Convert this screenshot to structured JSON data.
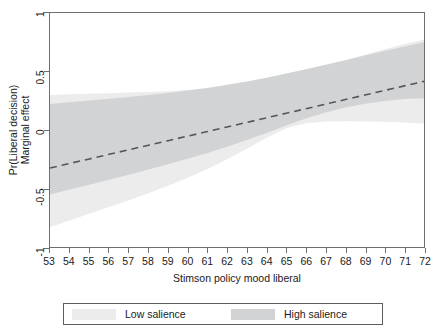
{
  "chart_data": {
    "type": "line",
    "title": "",
    "xlabel": "Stimson policy mood liberal",
    "ylabel_line1": "Pr(Liberal decision)",
    "ylabel_line2": "Marginal effect",
    "xlim": [
      53,
      72
    ],
    "ylim": [
      -1,
      1
    ],
    "grid": false,
    "legend_position": "bottom",
    "xticks": [
      53,
      54,
      55,
      56,
      57,
      58,
      59,
      60,
      61,
      62,
      63,
      64,
      65,
      66,
      67,
      68,
      69,
      70,
      71,
      72
    ],
    "xticklabels": [
      "53",
      "54",
      "55",
      "56",
      "57",
      "58",
      "59",
      "60",
      "61",
      "62",
      "63",
      "64",
      "65",
      "66",
      "67",
      "68",
      "69",
      "70",
      "71",
      "72"
    ],
    "yticks": [
      1,
      0.5,
      0,
      -0.5,
      -1
    ],
    "yticklabels": [
      "1",
      "0.5",
      "0",
      "-0.5",
      "-1"
    ],
    "x": [
      53,
      54,
      55,
      56,
      57,
      58,
      59,
      60,
      61,
      62,
      63,
      64,
      65,
      66,
      67,
      68,
      69,
      70,
      71,
      72
    ],
    "series": [
      {
        "name": "Marginal effect",
        "style": "dashed",
        "color": "#55555a",
        "values": [
          -0.325,
          -0.286,
          -0.247,
          -0.208,
          -0.169,
          -0.13,
          -0.091,
          -0.052,
          -0.013,
          0.026,
          0.065,
          0.104,
          0.143,
          0.182,
          0.221,
          0.26,
          0.299,
          0.338,
          0.377,
          0.416
        ]
      }
    ],
    "bands": [
      {
        "name": "Low salience",
        "color": "#ececed",
        "upper": [
          0.3,
          0.305,
          0.31,
          0.315,
          0.32,
          0.325,
          0.332,
          0.342,
          0.356,
          0.376,
          0.402,
          0.434,
          0.47,
          0.51,
          0.552,
          0.597,
          0.643,
          0.69,
          0.735,
          0.772
        ],
        "lower": [
          -0.83,
          -0.773,
          -0.716,
          -0.659,
          -0.6,
          -0.54,
          -0.476,
          -0.408,
          -0.333,
          -0.25,
          -0.16,
          -0.066,
          0.016,
          0.058,
          0.072,
          0.074,
          0.073,
          0.07,
          0.065,
          0.055
        ]
      },
      {
        "name": "High salience",
        "color": "#d2d3d4",
        "upper": [
          0.222,
          0.237,
          0.252,
          0.267,
          0.283,
          0.299,
          0.317,
          0.337,
          0.36,
          0.386,
          0.415,
          0.447,
          0.482,
          0.519,
          0.557,
          0.597,
          0.637,
          0.676,
          0.714,
          0.75
        ],
        "lower": [
          -0.552,
          -0.509,
          -0.467,
          -0.425,
          -0.382,
          -0.338,
          -0.293,
          -0.246,
          -0.196,
          -0.143,
          -0.086,
          -0.025,
          0.038,
          0.098,
          0.15,
          0.193,
          0.225,
          0.248,
          0.264,
          0.272
        ]
      }
    ]
  },
  "legend": {
    "entries": [
      {
        "label": "Low salience",
        "color": "#ececed"
      },
      {
        "label": "High salience",
        "color": "#d2d3d4"
      }
    ]
  },
  "axes": {
    "frame_color": "#6f6f6f"
  }
}
